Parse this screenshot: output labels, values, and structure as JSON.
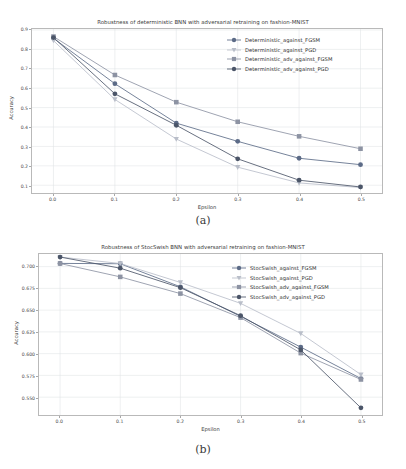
{
  "figures": [
    {
      "caption": "(a)",
      "chart_data": {
        "type": "line",
        "title": "Robustness of deterministic BNN with adversarial retraining on fashion-MNIST",
        "xlabel": "Epsilon",
        "ylabel": "Accuracy",
        "x": [
          0.0,
          0.1,
          0.2,
          0.3,
          0.4,
          0.5
        ],
        "xticks": [
          "0.0",
          "0.1",
          "0.2",
          "0.3",
          "0.4",
          "0.5"
        ],
        "yticks": [
          "0.1",
          "0.2",
          "0.3",
          "0.4",
          "0.5",
          "0.6",
          "0.7",
          "0.8",
          "0.9"
        ],
        "xlim": [
          -0.035,
          0.535
        ],
        "ylim": [
          0.06,
          0.905
        ],
        "grid": true,
        "legend_position": "upper right",
        "series": [
          {
            "name": "Deterministic_against_FGSM",
            "marker": "circle",
            "color": "#5c6b87",
            "values": [
              0.857,
              0.623,
              0.42,
              0.326,
              0.239,
              0.206
            ]
          },
          {
            "name": "Deterministic_against_PGD",
            "marker": "triangle-down",
            "color": "#b9bec9",
            "values": [
              0.845,
              0.542,
              0.338,
              0.193,
              0.112,
              0.088
            ]
          },
          {
            "name": "Deterministic_adv_against_FGSM",
            "marker": "square",
            "color": "#8d93a3",
            "values": [
              0.866,
              0.668,
              0.528,
              0.427,
              0.352,
              0.288
            ]
          },
          {
            "name": "Deterministic_adv_against_PGD",
            "marker": "circle",
            "color": "#4b5568",
            "values": [
              0.861,
              0.571,
              0.409,
              0.236,
              0.126,
              0.091
            ]
          }
        ]
      }
    },
    {
      "caption": "(b)",
      "chart_data": {
        "type": "line",
        "title": "Robustness of StocSwish BNN with adversarial retraining on fashion-MNIST",
        "xlabel": "Epsilon",
        "ylabel": "Accuracy",
        "x": [
          0.0,
          0.1,
          0.2,
          0.3,
          0.4,
          0.5
        ],
        "xticks": [
          "0.0",
          "0.1",
          "0.2",
          "0.3",
          "0.4",
          "0.5"
        ],
        "yticks": [
          "0.550",
          "0.575",
          "0.600",
          "0.625",
          "0.650",
          "0.675",
          "0.700"
        ],
        "xlim": [
          -0.035,
          0.535
        ],
        "ylim": [
          0.5295,
          0.7145
        ],
        "grid": true,
        "legend_position": "upper right",
        "series": [
          {
            "name": "StocSwish_against_FGSM",
            "marker": "circle",
            "color": "#5c6b87",
            "values": [
              0.7037,
              0.7033,
              0.6768,
              0.6428,
              0.6075,
              0.5714
            ]
          },
          {
            "name": "StocSwish_against_PGD",
            "marker": "triangle-down",
            "color": "#b9bec9",
            "values": [
              0.711,
              0.7036,
              0.6818,
              0.6578,
              0.6232,
              0.5759
            ]
          },
          {
            "name": "StocSwish_adv_against_FGSM",
            "marker": "square",
            "color": "#8d93a3",
            "values": [
              0.7036,
              0.6882,
              0.669,
              0.6414,
              0.6006,
              0.5703
            ]
          },
          {
            "name": "StocSwish_adv_against_PGD",
            "marker": "circle",
            "color": "#4b5568",
            "values": [
              0.711,
              0.6982,
              0.6758,
              0.6436,
              0.6043,
              0.5377
            ]
          }
        ]
      }
    }
  ]
}
